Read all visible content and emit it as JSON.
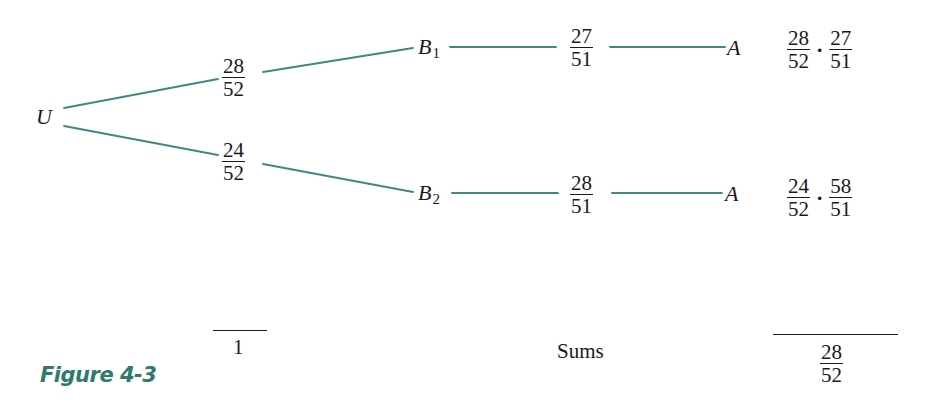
{
  "figure": {
    "caption": "Figure 4-3",
    "accent_color": "#2e7a6e",
    "line_color": "#3e8a80"
  },
  "tree": {
    "root": {
      "label": "U"
    },
    "first_stage": [
      {
        "prob_num": "28",
        "prob_den": "52",
        "node": "B",
        "node_sub": "1"
      },
      {
        "prob_num": "24",
        "prob_den": "52",
        "node": "B",
        "node_sub": "2"
      }
    ],
    "second_stage": [
      {
        "prob_num": "27",
        "prob_den": "51",
        "node": "A"
      },
      {
        "prob_num": "28",
        "prob_den": "51",
        "node": "A"
      }
    ],
    "path_products": [
      {
        "a_num": "28",
        "a_den": "52",
        "dot": "·",
        "b_num": "27",
        "b_den": "51"
      },
      {
        "a_num": "24",
        "a_den": "52",
        "dot": "·",
        "b_num": "58",
        "b_den": "51"
      }
    ]
  },
  "sums": {
    "label": "Sums",
    "first_stage_total": "1",
    "product_total_num": "28",
    "product_total_den": "52"
  }
}
